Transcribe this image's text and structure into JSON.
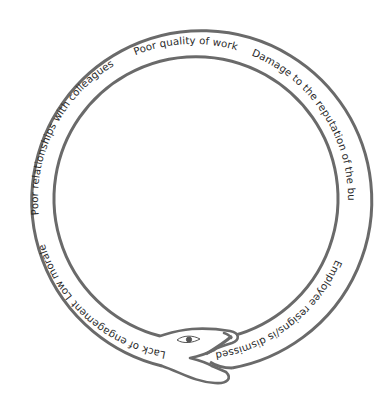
{
  "diagram": {
    "type": "ouroboros-cycle",
    "colors": {
      "stroke": "#6a6a6a",
      "text": "#2a2a2a",
      "background": "#ffffff"
    },
    "labels": [
      {
        "id": "poor-quality",
        "text": "Poor quality of work",
        "start_deg": -112
      },
      {
        "id": "damage-reputation",
        "text": "Damage to the reputation of the business",
        "start_deg": -68
      },
      {
        "id": "employee-resigns",
        "text": "Employee resigns/is dismissed",
        "start_deg": 23
      },
      {
        "id": "lack-engagement",
        "text": "Lack of engagement",
        "start_deg": 100
      },
      {
        "id": "low-morale",
        "text": "Low morale",
        "start_deg": 141
      },
      {
        "id": "poor-relationships",
        "text": "Poor relationships with colleagues",
        "start_deg": 174
      }
    ]
  }
}
